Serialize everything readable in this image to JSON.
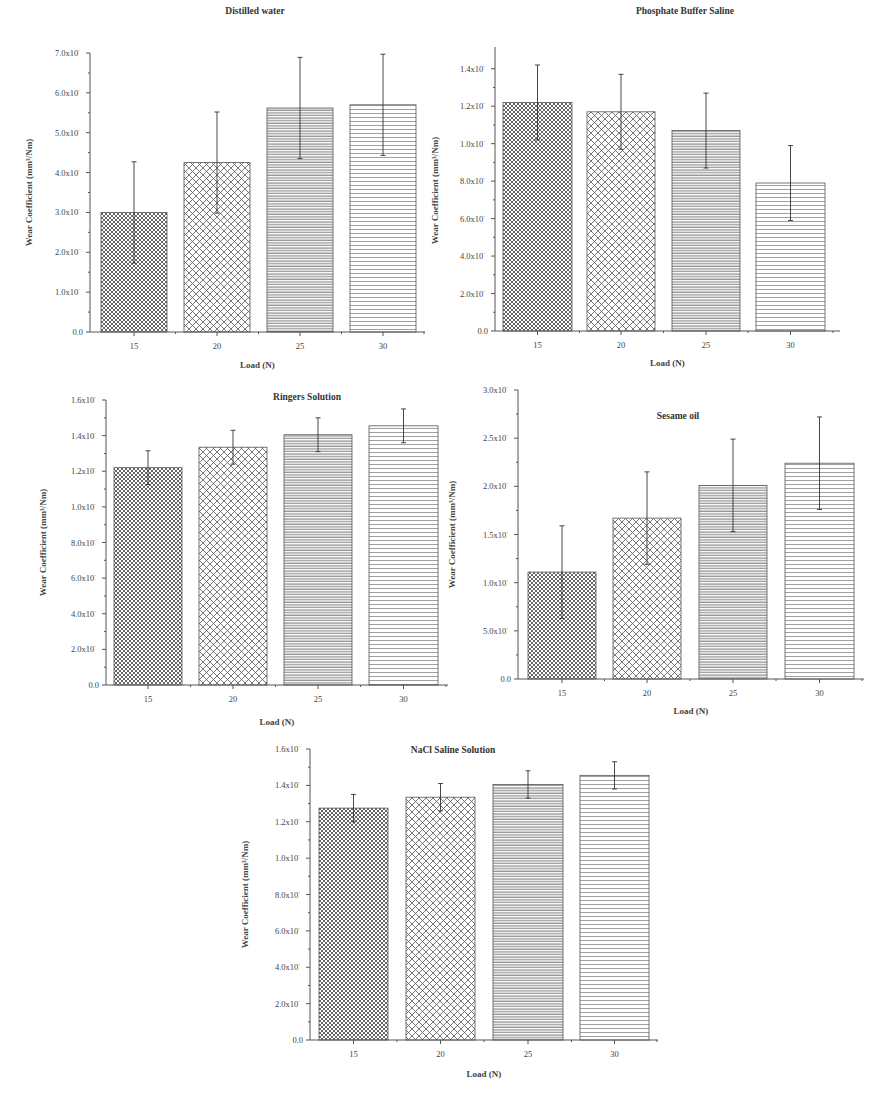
{
  "figure": {
    "y_axis_label": "Wear Coefficient (mm³/Nm)",
    "x_axis_label": "Load (N)",
    "categories": [
      "15",
      "20",
      "25",
      "30"
    ],
    "patterns": [
      "fine-crosshatch",
      "coarse-crosshatch",
      "dense-horizontal",
      "sparse-horizontal"
    ]
  },
  "chart_data": [
    {
      "type": "bar",
      "title": "Distilled water",
      "xlabel": "Load (N)",
      "ylabel": "Wear Coefficient (mm³/Nm)",
      "categories": [
        "15",
        "20",
        "25",
        "30"
      ],
      "values": [
        3.0,
        4.25,
        5.62,
        5.7
      ],
      "errors": [
        1.27,
        1.27,
        1.27,
        1.27
      ],
      "ylim": [
        0,
        7.0
      ],
      "yticks": [
        "0.0",
        "1.0x10",
        "2.0x10",
        "3.0x10",
        "4.0x10",
        "5.0x10",
        "6.0x10",
        "7.0x10"
      ],
      "ytick_values": [
        0,
        1,
        2,
        3,
        4,
        5,
        6,
        7
      ],
      "grid": false,
      "legend": null
    },
    {
      "type": "bar",
      "title": "Phosphate Buffer Saline",
      "xlabel": "Load (N)",
      "ylabel": "Wear Coefficient (mm³/Nm)",
      "categories": [
        "15",
        "20",
        "25",
        "30"
      ],
      "values": [
        1.22,
        1.17,
        1.07,
        0.79
      ],
      "errors": [
        0.2,
        0.2,
        0.2,
        0.2
      ],
      "ylim": [
        0,
        1.5
      ],
      "yticks": [
        "0.0",
        "2.0x10",
        "4.0x10",
        "6.0x10",
        "8.0x10",
        "1.0x10",
        "1.2x10",
        "1.4x10"
      ],
      "ytick_values": [
        0,
        0.2,
        0.4,
        0.6,
        0.8,
        1.0,
        1.2,
        1.4
      ],
      "grid": false,
      "legend": null
    },
    {
      "type": "bar",
      "title": "Ringers Solution",
      "xlabel": "Load (N)",
      "ylabel": "Wear Coefficient (mm³/Nm)",
      "categories": [
        "15",
        "20",
        "25",
        "30"
      ],
      "values": [
        1.22,
        1.335,
        1.405,
        1.455
      ],
      "errors": [
        0.095,
        0.095,
        0.095,
        0.095
      ],
      "ylim": [
        0,
        1.6
      ],
      "yticks": [
        "0.0",
        "2.0x10",
        "4.0x10",
        "6.0x10",
        "8.0x10",
        "1.0x10",
        "1.2x10",
        "1.4x10",
        "1.6x10"
      ],
      "ytick_values": [
        0,
        0.2,
        0.4,
        0.6,
        0.8,
        1.0,
        1.2,
        1.4,
        1.6
      ],
      "grid": false,
      "legend": null
    },
    {
      "type": "bar",
      "title": "Sesame oil",
      "xlabel": "Load (N)",
      "ylabel": "Wear Coefficient (mm³/Nm)",
      "categories": [
        "15",
        "20",
        "25",
        "30"
      ],
      "values": [
        1.11,
        1.67,
        2.01,
        2.24
      ],
      "errors": [
        0.48,
        0.48,
        0.48,
        0.48
      ],
      "ylim": [
        0,
        3.0
      ],
      "yticks": [
        "0.0",
        "5.0x10",
        "1.0x10",
        "1.5x10",
        "2.0x10",
        "2.5x10",
        "3.0x10"
      ],
      "ytick_values": [
        0,
        0.5,
        1.0,
        1.5,
        2.0,
        2.5,
        3.0
      ],
      "grid": false,
      "legend": null
    },
    {
      "type": "bar",
      "title": "NaCl Saline Solution",
      "xlabel": "Load (N)",
      "ylabel": "Wear Coefficient (mm³/Nm)",
      "categories": [
        "15",
        "20",
        "25",
        "30"
      ],
      "values": [
        1.275,
        1.335,
        1.405,
        1.455
      ],
      "errors": [
        0.075,
        0.075,
        0.075,
        0.075
      ],
      "ylim": [
        0,
        1.6
      ],
      "yticks": [
        "0.0",
        "2.0x10",
        "4.0x10",
        "6.0x10",
        "8.0x10",
        "1.0x10",
        "1.2x10",
        "1.4x10",
        "1.6x10"
      ],
      "ytick_values": [
        0,
        0.2,
        0.4,
        0.6,
        0.8,
        1.0,
        1.2,
        1.4,
        1.6
      ],
      "grid": false,
      "legend": null
    }
  ]
}
